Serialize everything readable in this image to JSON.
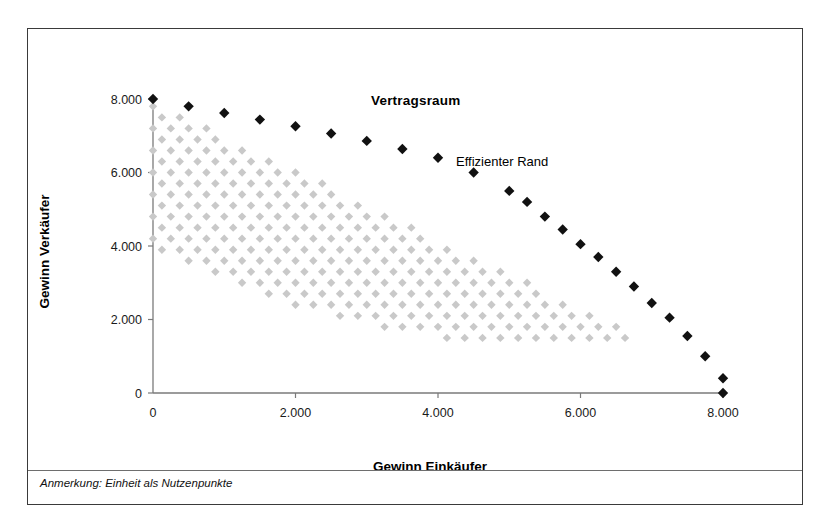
{
  "figure": {
    "border_color": "#3a3a3a",
    "background": "#ffffff"
  },
  "footnote": "Anmerkung: Einheit als Nutzenpunkte",
  "chart_data": {
    "type": "scatter",
    "title": "Vertragsraum",
    "xlabel": "Gewinn Einkäufer",
    "ylabel": "Gewinn Verkäufer",
    "xlim": [
      0,
      8000
    ],
    "ylim": [
      0,
      8000
    ],
    "xticks": [
      0,
      2000,
      4000,
      6000,
      8000
    ],
    "yticks": [
      0,
      2000,
      4000,
      6000,
      8000
    ],
    "xtick_labels": [
      "0",
      "2.000",
      "4.000",
      "6.000",
      "8.000"
    ],
    "ytick_labels": [
      "0",
      "2.000",
      "4.000",
      "6.000",
      "8.000"
    ],
    "grid": false,
    "legend": "none",
    "annotations": [
      {
        "text": "Vertragsraum",
        "x": 4100,
        "y": 8450,
        "weight": "bold"
      },
      {
        "text": "Effizienter Rand",
        "x": 5300,
        "y": 6950,
        "weight": "normal"
      }
    ],
    "series": [
      {
        "name": "Vertragsraum",
        "marker": "diamond",
        "color": "#c9c9c9",
        "marker_size": 4.2,
        "description": "Lens-shaped lattice of feasible bargaining outcomes between buyer and seller profits",
        "lattice": {
          "x_step": 250,
          "y_step": 300,
          "x_start": 0,
          "x_end": 8000,
          "y_start": 0,
          "y_end": 8000,
          "upper_boundary": "y <= 8000 - 0.94*x",
          "lower_boundary": "y >= 8000 - 0.94*x - 4100 + 0.000085*x*x"
        }
      },
      {
        "name": "Effizienter Rand",
        "marker": "diamond",
        "color": "#111111",
        "marker_size": 5.2,
        "points": [
          {
            "x": 0,
            "y": 8000
          },
          {
            "x": 500,
            "y": 7800
          },
          {
            "x": 1000,
            "y": 7620
          },
          {
            "x": 1500,
            "y": 7440
          },
          {
            "x": 2000,
            "y": 7260
          },
          {
            "x": 2500,
            "y": 7060
          },
          {
            "x": 3000,
            "y": 6860
          },
          {
            "x": 3500,
            "y": 6640
          },
          {
            "x": 4000,
            "y": 6400
          },
          {
            "x": 4500,
            "y": 6000
          },
          {
            "x": 5000,
            "y": 5500
          },
          {
            "x": 5250,
            "y": 5200
          },
          {
            "x": 5500,
            "y": 4800
          },
          {
            "x": 5750,
            "y": 4450
          },
          {
            "x": 6000,
            "y": 4050
          },
          {
            "x": 6250,
            "y": 3700
          },
          {
            "x": 6500,
            "y": 3300
          },
          {
            "x": 6750,
            "y": 2900
          },
          {
            "x": 7000,
            "y": 2450
          },
          {
            "x": 7250,
            "y": 2050
          },
          {
            "x": 7500,
            "y": 1550
          },
          {
            "x": 7750,
            "y": 1000
          },
          {
            "x": 8000,
            "y": 400
          },
          {
            "x": 8000,
            "y": 0
          }
        ]
      }
    ]
  }
}
